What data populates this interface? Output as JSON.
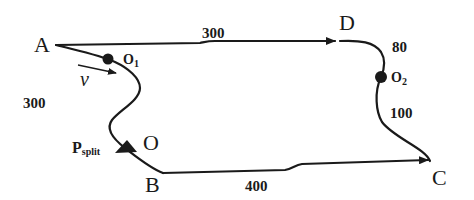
{
  "nodes": {
    "A": "A",
    "B": "B",
    "C": "C",
    "D": "D",
    "O": "O"
  },
  "points": {
    "o1_main": "O",
    "o1_sub": "1",
    "o2_main": "O",
    "o2_sub": "2",
    "psplit_main": "P",
    "psplit_sub": "split"
  },
  "distances": {
    "A_D": "300",
    "D_O2": "80",
    "O2_C": "100",
    "A_B": "300",
    "B_C": "400"
  },
  "velocity": {
    "label": "v"
  },
  "colors": {
    "stroke": "#1a1a1a",
    "background": "#ffffff"
  }
}
